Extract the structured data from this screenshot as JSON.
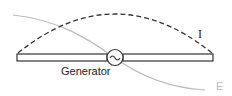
{
  "diagram": {
    "labels": {
      "generator": "Generator",
      "current": "I",
      "field": "E",
      "generator_symbol": "~"
    },
    "colors": {
      "antenna": "#333333",
      "current_curve": "#333333",
      "field_curve": "#bbbbbb"
    }
  }
}
